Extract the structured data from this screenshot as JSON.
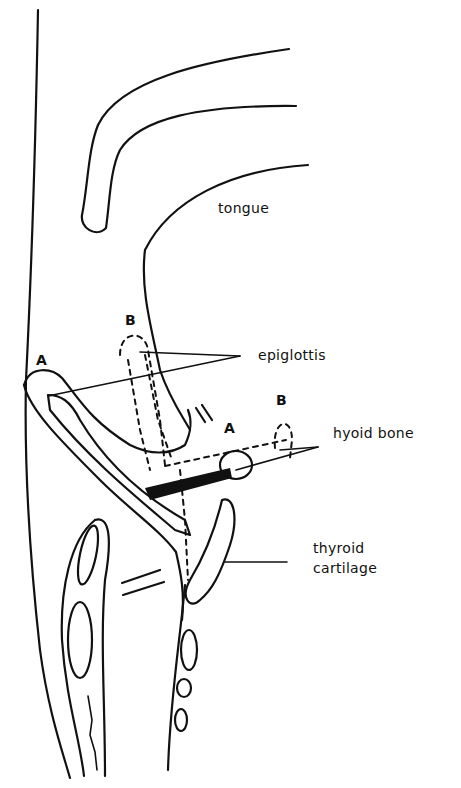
{
  "diagram": {
    "type": "anatomical-sagittal-section",
    "labels": {
      "tongue": "tongue",
      "epiglottis": "epiglottis",
      "hyoid_bone": "hyoid bone",
      "thyroid_cartilage_line1": "thyroid",
      "thyroid_cartilage_line2": "cartilage"
    },
    "position_markers": {
      "epiglottis_A": "A",
      "epiglottis_B": "B",
      "hyoid_A": "A",
      "hyoid_B": "B"
    },
    "colors": {
      "ink": "#111111",
      "background": "#ffffff"
    }
  }
}
